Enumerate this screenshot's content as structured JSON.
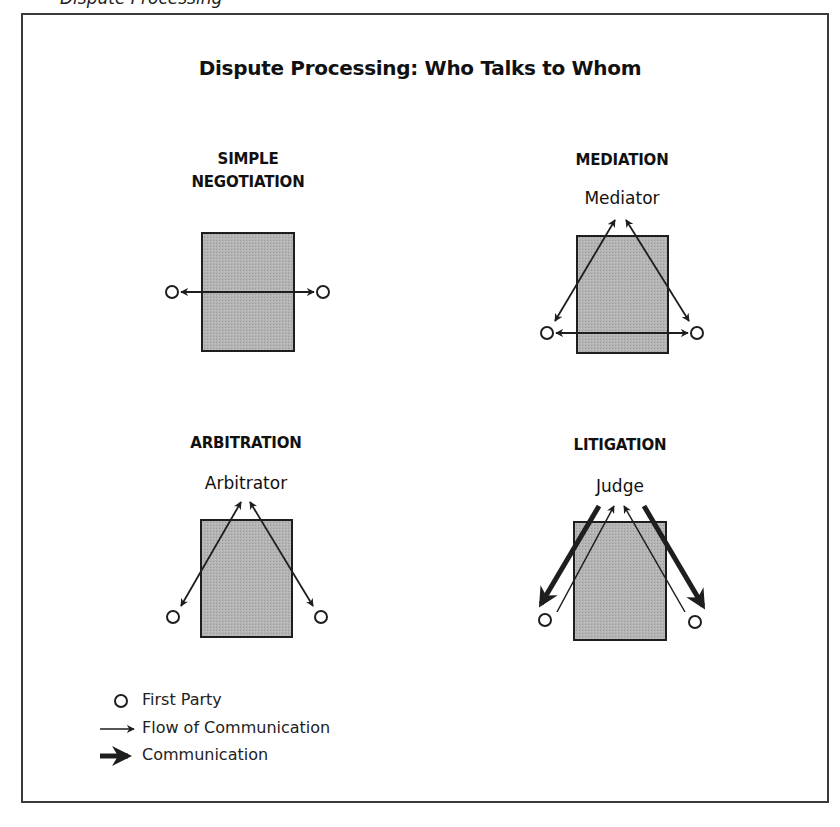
{
  "header_fragment": "Dispute Processing",
  "title": "Dispute Processing: Who Talks to Whom",
  "panels": {
    "simple_negotiation": {
      "label_line1": "SIMPLE",
      "label_line2": "NEGOTIATION",
      "third_party": ""
    },
    "mediation": {
      "label": "MEDIATION",
      "third_party": "Mediator"
    },
    "arbitration": {
      "label": "ARBITRATION",
      "third_party": "Arbitrator"
    },
    "litigation": {
      "label": "LITIGATION",
      "third_party": "Judge"
    }
  },
  "legend": {
    "items": [
      {
        "symbol": "circle-icon",
        "label": "First Party"
      },
      {
        "symbol": "thin-arrow-icon",
        "label": "Flow of Communication"
      },
      {
        "symbol": "thick-arrow-icon",
        "label": "Communication"
      }
    ]
  },
  "colors": {
    "box_fill": "#b4b4b4",
    "stroke": "#1e1e1e",
    "frame": "#3a3a3a"
  }
}
